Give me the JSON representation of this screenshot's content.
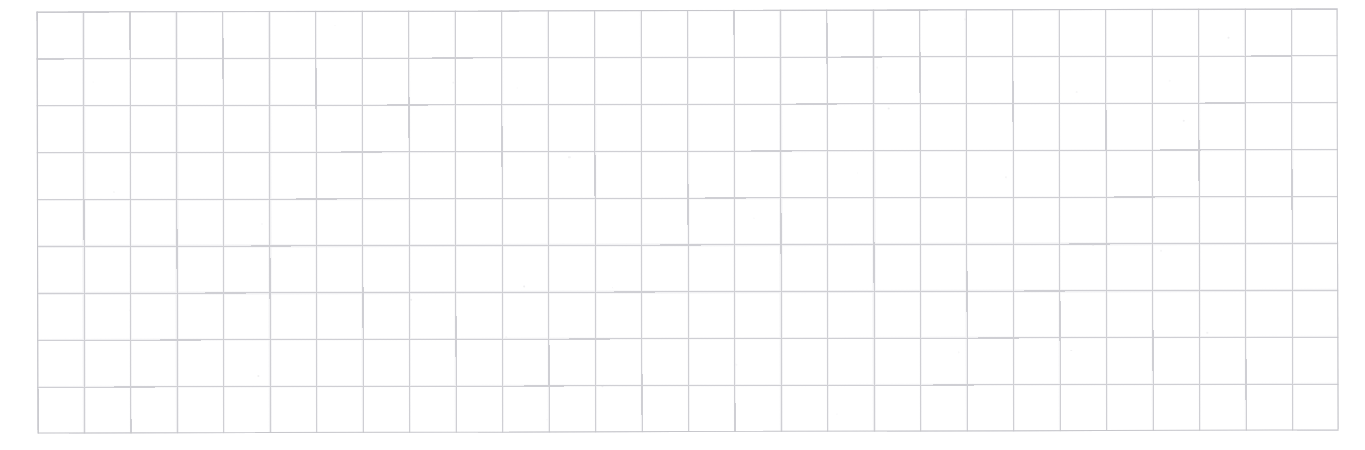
{
  "document": {
    "kind": "scanned-grid-sheet",
    "title": "Blank ruled grid sheet",
    "page_width": 1365,
    "page_height": 450,
    "background_color": "#ffffff",
    "text_content": "",
    "annotations": [],
    "has_visible_text": false
  },
  "grid": {
    "columns": 28,
    "rows": 9,
    "cell_width": 46.46,
    "cell_height": 46.89,
    "left": 37,
    "top": 10,
    "width": 1301,
    "height": 422,
    "line_color": "#cfcfd4",
    "frame_color": "#c6c6cb",
    "line_width": 1.1,
    "fill_color": "#ffffff"
  },
  "margins": {
    "left": 37,
    "top": 10,
    "right": 27,
    "bottom": 18
  },
  "scan": {
    "rotation_deg": -0.14,
    "noise_opacity": 0.55,
    "speck_count": 34
  }
}
